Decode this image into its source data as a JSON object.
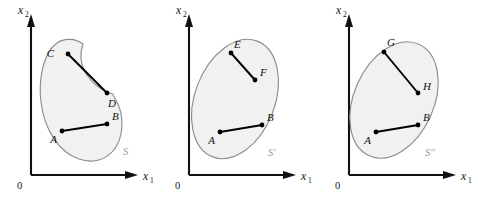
{
  "figure": {
    "background_color": "#ffffff",
    "shape_fill_color": "#f1f1f1",
    "shape_stroke_color": "#8d8d8d",
    "chord_color": "#000000",
    "axis_color": "#111111",
    "set_label_color": "#9a9a9a"
  },
  "panels": [
    {
      "id": "panel-1",
      "set_label": "S",
      "origin_label": "0",
      "axis_x_label": "x",
      "axis_x_sub": "1",
      "axis_y_label": "x",
      "axis_y_sub": "2",
      "shape_type": "non-convex-crescent",
      "points": [
        {
          "label": "C",
          "x": 68,
          "y": 54,
          "label_dx": -12,
          "label_dy": 2
        },
        {
          "label": "D",
          "x": 107,
          "y": 93,
          "label_dx": 2,
          "label_dy": 13
        },
        {
          "label": "A",
          "x": 62,
          "y": 131,
          "label_dx": -12,
          "label_dy": 11
        },
        {
          "label": "B",
          "x": 107,
          "y": 124,
          "label_dx": 4,
          "label_dy": -4
        }
      ],
      "segments": [
        {
          "from": "C",
          "to": "D",
          "inside_set": false
        },
        {
          "from": "A",
          "to": "B",
          "inside_set": true
        }
      ]
    },
    {
      "id": "panel-2",
      "set_label": "S'",
      "origin_label": "0",
      "axis_x_label": "x",
      "axis_x_sub": "1",
      "axis_y_label": "x",
      "axis_y_sub": "2",
      "shape_type": "convex-ellipse",
      "points": [
        {
          "label": "E",
          "x": 231,
          "y": 53,
          "label_dx": -2,
          "label_dy": -5
        },
        {
          "label": "F",
          "x": 255,
          "y": 80,
          "label_dx": 4,
          "label_dy": -4
        },
        {
          "label": "A",
          "x": 220,
          "y": 132,
          "label_dx": -12,
          "label_dy": 11
        },
        {
          "label": "B",
          "x": 262,
          "y": 125,
          "label_dx": 5,
          "label_dy": -4
        }
      ],
      "segments": [
        {
          "from": "E",
          "to": "F",
          "inside_set": true
        },
        {
          "from": "A",
          "to": "B",
          "inside_set": true
        }
      ]
    },
    {
      "id": "panel-3",
      "set_label": "S''",
      "origin_label": "0",
      "axis_x_label": "x",
      "axis_x_sub": "1",
      "axis_y_label": "x",
      "axis_y_sub": "2",
      "shape_type": "convex-ellipse-tilted",
      "points": [
        {
          "label": "G",
          "x": 384,
          "y": 52,
          "label_dx": -2,
          "label_dy": -6
        },
        {
          "label": "H",
          "x": 418,
          "y": 93,
          "label_dx": 5,
          "label_dy": -3
        },
        {
          "label": "A",
          "x": 376,
          "y": 132,
          "label_dx": -12,
          "label_dy": 11
        },
        {
          "label": "B",
          "x": 418,
          "y": 125,
          "label_dx": 5,
          "label_dy": -4
        }
      ],
      "segments": [
        {
          "from": "G",
          "to": "H",
          "inside_set": true
        },
        {
          "from": "A",
          "to": "B",
          "inside_set": true
        }
      ]
    }
  ]
}
